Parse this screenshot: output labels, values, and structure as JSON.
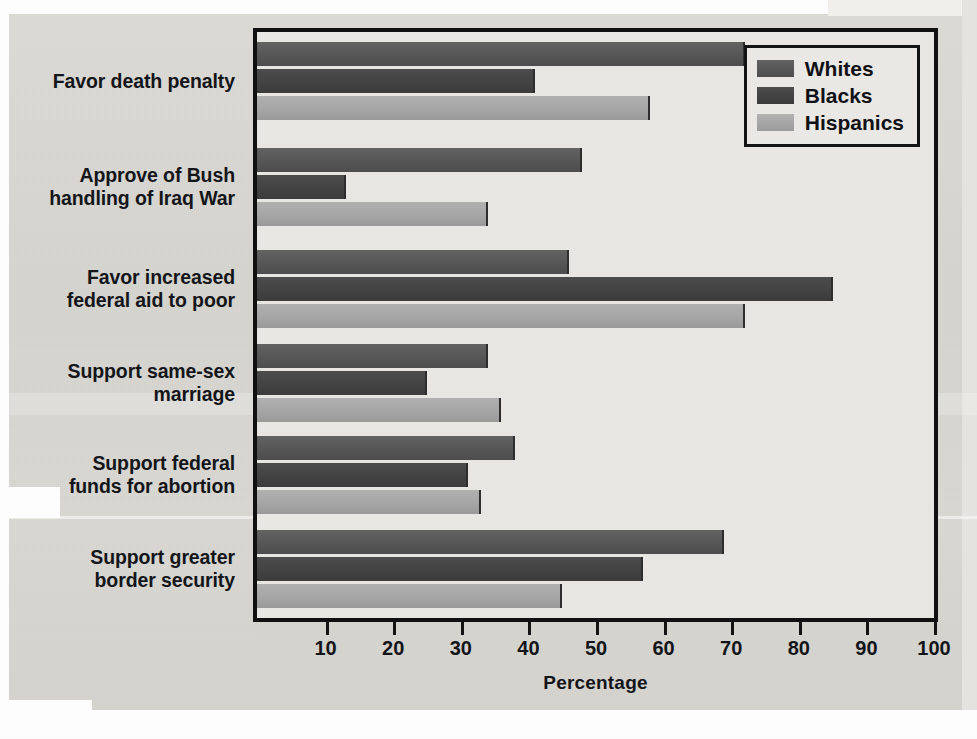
{
  "chart_data": {
    "type": "bar",
    "orientation": "horizontal",
    "title": "",
    "xlabel": "Percentage",
    "ylabel": "",
    "xlim": [
      0,
      100
    ],
    "xticks": [
      10,
      20,
      30,
      40,
      50,
      60,
      70,
      80,
      90,
      100
    ],
    "grid": false,
    "legend_position": "top-right",
    "categories": [
      "Favor death penalty",
      "Approve of Bush handling of Iraq War",
      "Favor increased federal aid to poor",
      "Support same-sex marriage",
      "Support federal funds for abortion",
      "Support greater border security"
    ],
    "series": [
      {
        "name": "Whites",
        "color": "#565656",
        "values": [
          72,
          48,
          46,
          34,
          38,
          69
        ]
      },
      {
        "name": "Blacks",
        "color": "#434343",
        "values": [
          41,
          13,
          85,
          25,
          31,
          57
        ]
      },
      {
        "name": "Hispanics",
        "color": "#a6a6a6",
        "values": [
          58,
          34,
          72,
          36,
          33,
          45
        ]
      }
    ]
  },
  "categories_display": [
    {
      "line1": "Favor death penalty",
      "line2": ""
    },
    {
      "line1": "Approve of Bush",
      "line2": "handling of Iraq War"
    },
    {
      "line1": "Favor increased",
      "line2": "federal aid to poor"
    },
    {
      "line1": "Support same-sex",
      "line2": "marriage"
    },
    {
      "line1": "Support federal",
      "line2": "funds for abortion"
    },
    {
      "line1": "Support greater",
      "line2": "border security"
    }
  ],
  "legend": {
    "items": [
      {
        "label": "Whites"
      },
      {
        "label": "Blacks"
      },
      {
        "label": "Hispanics"
      }
    ]
  },
  "axis": {
    "x_title": "Percentage",
    "tick_labels": [
      "10",
      "20",
      "30",
      "40",
      "50",
      "60",
      "70",
      "80",
      "90",
      "100"
    ]
  }
}
